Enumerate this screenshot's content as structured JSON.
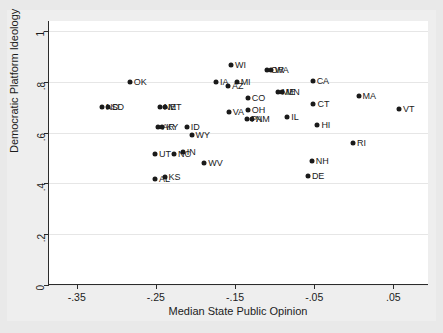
{
  "chart_data": {
    "type": "scatter",
    "title": "",
    "xlabel": "Median State Public Opinion",
    "ylabel": "Democratic Platform Ideology",
    "xlim": [
      -0.385,
      -0.385
    ],
    "x_range": [
      -0.385,
      0.095
    ],
    "ylim": [
      0,
      1.04
    ],
    "xticks": [
      -0.35,
      -0.25,
      -0.15,
      -0.05,
      0.05
    ],
    "xtick_labels": [
      "-.35",
      "-.25",
      "-.15",
      "-.05",
      ".05"
    ],
    "yticks": [
      0,
      0.2,
      0.4,
      0.6,
      0.8,
      1
    ],
    "ytick_labels": [
      "0",
      ".2",
      ".4",
      ".6",
      ".8",
      "1"
    ],
    "grid": "horizontal",
    "legend": "none",
    "marker_color": "#1a1a1a",
    "points": [
      {
        "label": "OK",
        "x": -0.283,
        "y": 0.8,
        "lx": 4,
        "ly": 0
      },
      {
        "label": "ND",
        "x": -0.318,
        "y": 0.7,
        "lx": 4,
        "ly": 0
      },
      {
        "label": "SD",
        "x": -0.311,
        "y": 0.7,
        "lx": 4,
        "ly": 0
      },
      {
        "label": "NE",
        "x": -0.245,
        "y": 0.7,
        "lx": 4,
        "ly": 0
      },
      {
        "label": "MT",
        "x": -0.239,
        "y": 0.7,
        "lx": 4,
        "ly": 0
      },
      {
        "label": "AR",
        "x": -0.247,
        "y": 0.622,
        "lx": 4,
        "ly": 0
      },
      {
        "label": "KY",
        "x": -0.242,
        "y": 0.622,
        "lx": 4,
        "ly": 0
      },
      {
        "label": "ID",
        "x": -0.211,
        "y": 0.621,
        "lx": 4,
        "ly": 0
      },
      {
        "label": "WY",
        "x": -0.205,
        "y": 0.592,
        "lx": 4,
        "ly": 0
      },
      {
        "label": "UT",
        "x": -0.251,
        "y": 0.518,
        "lx": 4,
        "ly": 0
      },
      {
        "label": "NC",
        "x": -0.227,
        "y": 0.518,
        "lx": 4,
        "ly": 0
      },
      {
        "label": "IN",
        "x": -0.216,
        "y": 0.525,
        "lx": 4,
        "ly": 0
      },
      {
        "label": "AL",
        "x": -0.251,
        "y": 0.419,
        "lx": 4,
        "ly": 0
      },
      {
        "label": "KS",
        "x": -0.239,
        "y": 0.425,
        "lx": 4,
        "ly": 0
      },
      {
        "label": "WV",
        "x": -0.189,
        "y": 0.481,
        "lx": 4,
        "ly": 0
      },
      {
        "label": "IA",
        "x": -0.174,
        "y": 0.801,
        "lx": 4,
        "ly": 0
      },
      {
        "label": "WI",
        "x": -0.155,
        "y": 0.868,
        "lx": 4,
        "ly": 0
      },
      {
        "label": "AZ",
        "x": -0.159,
        "y": 0.782,
        "lx": 4,
        "ly": 0
      },
      {
        "label": "MI",
        "x": -0.148,
        "y": 0.801,
        "lx": 4,
        "ly": 0
      },
      {
        "label": "VA",
        "x": -0.158,
        "y": 0.681,
        "lx": 4,
        "ly": 0
      },
      {
        "label": "CO",
        "x": -0.134,
        "y": 0.737,
        "lx": 4,
        "ly": 0
      },
      {
        "label": "OH",
        "x": -0.134,
        "y": 0.69,
        "lx": 4,
        "ly": 0
      },
      {
        "label": "PA",
        "x": -0.135,
        "y": 0.653,
        "lx": 4,
        "ly": 0
      },
      {
        "label": "NM",
        "x": -0.129,
        "y": 0.653,
        "lx": 4,
        "ly": 0
      },
      {
        "label": "OR",
        "x": -0.11,
        "y": 0.847,
        "lx": 4,
        "ly": 0
      },
      {
        "label": "WA",
        "x": -0.105,
        "y": 0.847,
        "lx": 4,
        "ly": 0
      },
      {
        "label": "ME",
        "x": -0.096,
        "y": 0.759,
        "lx": 4,
        "ly": 0
      },
      {
        "label": "MN",
        "x": -0.091,
        "y": 0.759,
        "lx": 4,
        "ly": 0
      },
      {
        "label": "IL",
        "x": -0.084,
        "y": 0.663,
        "lx": 4,
        "ly": 0
      },
      {
        "label": "CA",
        "x": -0.052,
        "y": 0.803,
        "lx": 4,
        "ly": 0
      },
      {
        "label": "CT",
        "x": -0.051,
        "y": 0.713,
        "lx": 4,
        "ly": 0
      },
      {
        "label": "HI",
        "x": -0.046,
        "y": 0.629,
        "lx": 4,
        "ly": 0
      },
      {
        "label": "NH",
        "x": -0.053,
        "y": 0.49,
        "lx": 4,
        "ly": 0
      },
      {
        "label": "DE",
        "x": -0.058,
        "y": 0.43,
        "lx": 4,
        "ly": 0
      },
      {
        "label": "MA",
        "x": 0.006,
        "y": 0.746,
        "lx": 4,
        "ly": 0
      },
      {
        "label": "RI",
        "x": -0.001,
        "y": 0.559,
        "lx": 4,
        "ly": 0
      },
      {
        "label": "VT",
        "x": 0.057,
        "y": 0.692,
        "lx": 4,
        "ly": 0
      }
    ]
  }
}
